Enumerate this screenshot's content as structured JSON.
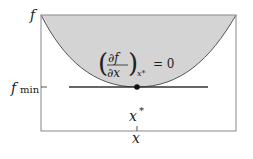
{
  "diagram": {
    "type": "function-minimum-illustration",
    "axes": {
      "y_label": "f",
      "x_label": "x"
    },
    "curve": {
      "shape": "parabola",
      "fill_color": "#d4d4d4",
      "stroke_color": "#555555"
    },
    "minimum": {
      "value_label_base": "f",
      "value_label_sub": "min",
      "location_label": "x",
      "location_label_sup": "*",
      "tangent_line_color": "#333333",
      "point_color": "#111111"
    },
    "condition": {
      "numerator": "∂f",
      "denominator": "∂x",
      "subscript": "x*",
      "equals": "= 0"
    },
    "colors": {
      "frame": "#888888",
      "background": "#ffffff"
    }
  }
}
